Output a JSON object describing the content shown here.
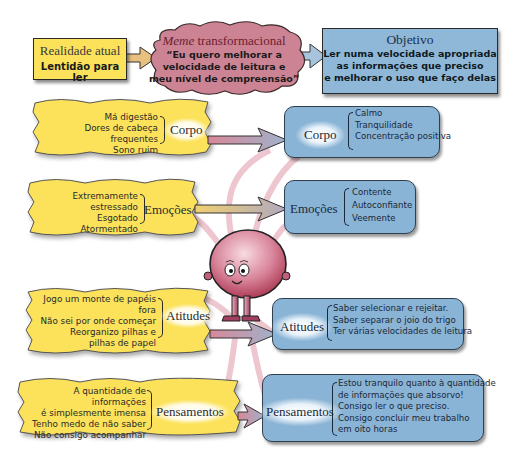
{
  "realidade": {
    "title": "Realidade atual",
    "subtitle": "Lentidão para ler"
  },
  "meme": {
    "title_italic": "Meme",
    "title_rest": " transformacional",
    "quote_lines": [
      "“Eu quero melhorar a",
      "velocidade de leitura e",
      "meu nível de compreensão”"
    ]
  },
  "objetivo": {
    "title": "Objetivo",
    "lines": [
      "Ler numa velocidade apropriada",
      "as informações que preciso",
      "e melhorar o uso que faço delas"
    ]
  },
  "left": [
    {
      "category": "Corpo",
      "items": [
        "Má digestão",
        "Dores de cabeça frequentes",
        "Sono ruim"
      ]
    },
    {
      "category": "Emoções",
      "items": [
        "Extremamente estressado",
        "Esgotado",
        "Atormentado"
      ]
    },
    {
      "category": "Atitudes",
      "items": [
        "Jogo um monte de papéis fora",
        "Não sei por onde começar",
        "Reorganizo pilhas e",
        "pilhas de papel"
      ]
    },
    {
      "category": "Pensamentos",
      "items": [
        "A quantidade de informações",
        "é simplesmente imensa",
        "Tenho medo de não saber",
        "Não consigo acompanhar"
      ]
    }
  ],
  "right": [
    {
      "category": "Corpo",
      "items": [
        "Calmo",
        "Tranquilidade",
        "Concentração positiva"
      ]
    },
    {
      "category": "Emoções",
      "items": [
        "Contente",
        "Autoconfiante",
        "Veemente"
      ]
    },
    {
      "category": "Atitudes",
      "items": [
        "Saber selecionar e rejeitar.",
        "Saber separar o joio do trigo",
        "Ter várias velocidades de leitura"
      ]
    },
    {
      "category": "Pensamentos",
      "items": [
        "Estou tranquilo quanto à quantidade",
        "de informações que absorvo!",
        "Consigo ler o que preciso.",
        "Consigo concluir meu trabalho",
        "em oito horas"
      ]
    }
  ],
  "colors": {
    "yellow_panel": "#fbe25a",
    "blue_box": "#8ab4d6",
    "meme_cloud": "#c97a8a",
    "character": "#b84a68",
    "arrow_pink": "#d99aaa",
    "arrow_blue": "#a8b8d0"
  }
}
